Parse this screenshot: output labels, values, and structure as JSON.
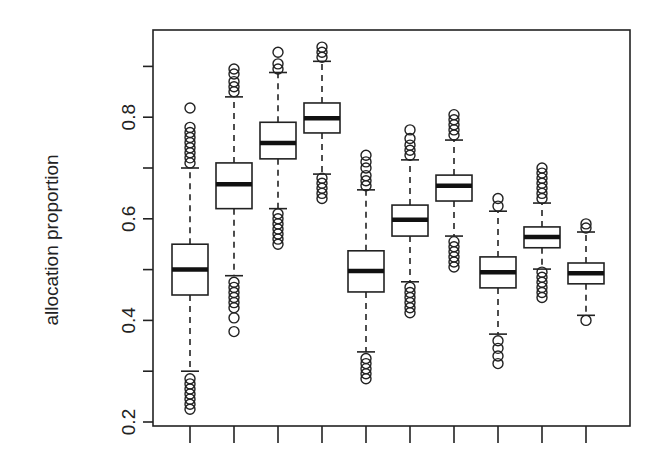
{
  "chart_data": {
    "type": "boxplot",
    "title": "",
    "xlabel": "",
    "ylabel": "allocation proportion",
    "ylim": [
      0.2,
      0.95
    ],
    "yticks": [
      0.2,
      0.3,
      0.4,
      0.5,
      0.6,
      0.7,
      0.8,
      0.9
    ],
    "ytick_labels": [
      "0.2",
      "",
      "0.4",
      "",
      "0.6",
      "",
      "0.8",
      ""
    ],
    "x_tick_count": 10,
    "x_tick_labels": [
      "",
      "",
      "",
      "",
      "",
      "",
      "",
      "",
      "",
      ""
    ],
    "grid": false,
    "legend": null,
    "boxes": [
      {
        "index": 1,
        "whisker_low": 0.3,
        "q1": 0.45,
        "median": 0.5,
        "q3": 0.55,
        "whisker_high": 0.7,
        "outliers_low": [
          0.225,
          0.235,
          0.245,
          0.255,
          0.265,
          0.275,
          0.285
        ],
        "outliers_high": [
          0.71,
          0.72,
          0.73,
          0.74,
          0.75,
          0.76,
          0.77,
          0.78,
          0.818
        ]
      },
      {
        "index": 2,
        "whisker_low": 0.488,
        "q1": 0.62,
        "median": 0.668,
        "q3": 0.71,
        "whisker_high": 0.84,
        "outliers_low": [
          0.378,
          0.405,
          0.425,
          0.435,
          0.445,
          0.455,
          0.465,
          0.475
        ],
        "outliers_high": [
          0.85,
          0.86,
          0.87,
          0.885,
          0.895
        ]
      },
      {
        "index": 3,
        "whisker_low": 0.62,
        "q1": 0.718,
        "median": 0.749,
        "q3": 0.79,
        "whisker_high": 0.888,
        "outliers_low": [
          0.55,
          0.56,
          0.57,
          0.58,
          0.59,
          0.6,
          0.61
        ],
        "outliers_high": [
          0.895,
          0.905,
          0.928
        ]
      },
      {
        "index": 4,
        "whisker_low": 0.688,
        "q1": 0.769,
        "median": 0.798,
        "q3": 0.828,
        "whisker_high": 0.91,
        "outliers_low": [
          0.64,
          0.65,
          0.66,
          0.67,
          0.68
        ],
        "outliers_high": [
          0.918,
          0.928,
          0.938
        ]
      },
      {
        "index": 5,
        "whisker_low": 0.338,
        "q1": 0.456,
        "median": 0.497,
        "q3": 0.537,
        "whisker_high": 0.657,
        "outliers_low": [
          0.285,
          0.295,
          0.305,
          0.315,
          0.325
        ],
        "outliers_high": [
          0.665,
          0.675,
          0.685,
          0.7,
          0.712,
          0.725
        ]
      },
      {
        "index": 6,
        "whisker_low": 0.476,
        "q1": 0.566,
        "median": 0.598,
        "q3": 0.627,
        "whisker_high": 0.716,
        "outliers_low": [
          0.415,
          0.425,
          0.435,
          0.445,
          0.455,
          0.465
        ],
        "outliers_high": [
          0.725,
          0.735,
          0.745,
          0.758,
          0.775
        ]
      },
      {
        "index": 7,
        "whisker_low": 0.566,
        "q1": 0.635,
        "median": 0.665,
        "q3": 0.686,
        "whisker_high": 0.755,
        "outliers_low": [
          0.505,
          0.515,
          0.525,
          0.535,
          0.545,
          0.555
        ],
        "outliers_high": [
          0.765,
          0.775,
          0.785,
          0.795,
          0.805
        ]
      },
      {
        "index": 8,
        "whisker_low": 0.373,
        "q1": 0.464,
        "median": 0.495,
        "q3": 0.525,
        "whisker_high": 0.615,
        "outliers_low": [
          0.315,
          0.33,
          0.345,
          0.36
        ],
        "outliers_high": [
          0.625,
          0.64
        ]
      },
      {
        "index": 9,
        "whisker_low": 0.501,
        "q1": 0.543,
        "median": 0.564,
        "q3": 0.584,
        "whisker_high": 0.631,
        "outliers_low": [
          0.445,
          0.455,
          0.465,
          0.475,
          0.485,
          0.495
        ],
        "outliers_high": [
          0.64,
          0.65,
          0.66,
          0.67,
          0.68,
          0.69,
          0.7
        ]
      },
      {
        "index": 10,
        "whisker_low": 0.41,
        "q1": 0.472,
        "median": 0.493,
        "q3": 0.513,
        "whisker_high": 0.574,
        "outliers_low": [
          0.4
        ],
        "outliers_high": [
          0.582,
          0.59
        ]
      }
    ]
  }
}
